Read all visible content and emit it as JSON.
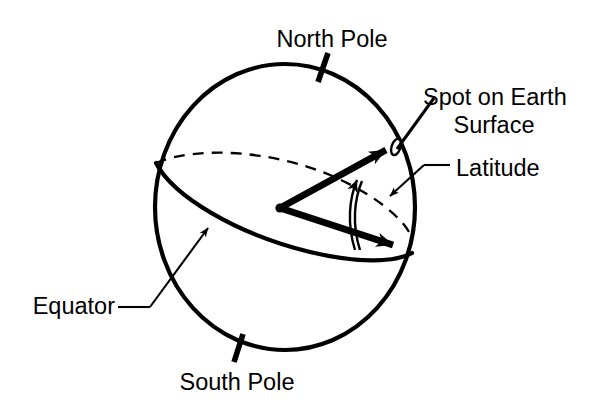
{
  "diagram": {
    "background_color": "#ffffff",
    "stroke_color": "#000000",
    "labels": {
      "north_pole": "North Pole",
      "south_pole": "South Pole",
      "equator": "Equator",
      "spot_line1": "Spot on Earth",
      "spot_line2": "Surface",
      "latitude": "Latitude"
    },
    "elements": {
      "sphere": "earth-sphere-outline",
      "equator_front": "equator-front-arc",
      "equator_back": "equator-back-arc-dashed",
      "north_pole_tick": "north-pole-axis-tick",
      "south_pole_tick": "south-pole-axis-tick",
      "center_dot": "earth-center-point",
      "radius_to_spot": "radius-arrow-to-spot",
      "radius_to_equator": "radius-arrow-to-equator",
      "latitude_angle_arc": "latitude-angle-arc-arrow",
      "spot_marker": "spot-on-earth-marker",
      "equator_leader": "equator-leader-arrow",
      "spot_leader": "spot-leader-line",
      "latitude_leader": "latitude-leader-arrow"
    },
    "geometry": {
      "sphere_center_x": 285,
      "sphere_center_y": 207,
      "sphere_radius_x": 130,
      "sphere_radius_y": 143,
      "origin_x": 280,
      "origin_y": 208,
      "spot_x": 392,
      "spot_y": 146,
      "equator_point_x": 400,
      "equator_point_y": 249
    }
  }
}
